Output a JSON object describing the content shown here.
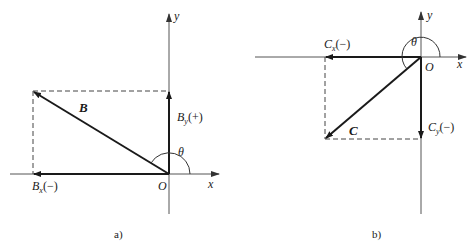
{
  "panels": [
    {
      "id": "a",
      "caption": "a)",
      "axis_x_label": "x",
      "axis_y_label": "y",
      "origin_label": "O",
      "vector_label": "B",
      "x_component_label": "B",
      "x_component_sub": "x",
      "x_component_sign": "(−)",
      "y_component_label": "B",
      "y_component_sub": "y",
      "y_component_sign": "(+)",
      "angle_label": "θ"
    },
    {
      "id": "b",
      "caption": "b)",
      "axis_x_label": "x",
      "axis_y_label": "y",
      "origin_label": "O",
      "vector_label": "C",
      "x_component_label": "C",
      "x_component_sub": "x",
      "x_component_sign": "(−)",
      "y_component_label": "C",
      "y_component_sub": "y",
      "y_component_sign": "(−)",
      "angle_label": "θ"
    }
  ],
  "colors": {
    "ink": "#1a1a1a",
    "axis": "#555555",
    "dash": "#444444"
  }
}
